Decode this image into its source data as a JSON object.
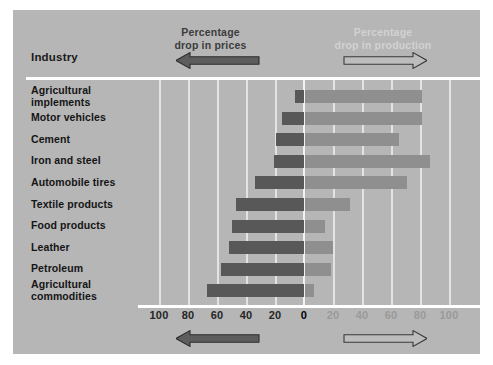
{
  "figure": {
    "background_color": "#b6b6b6",
    "page_color": "#ffffff",
    "industry_heading": "Industry",
    "left_title": "Percentage\ndrop in prices",
    "right_title": "Percentage\ndrop in production",
    "left_arrow_name": "left-pointing-arrow",
    "right_arrow_name": "right-pointing-arrow",
    "bar_left_color": "#585858",
    "bar_right_color": "#8f8f8f",
    "left_title_color": "#3c3c3c",
    "right_title_color": "#d2d2d2"
  },
  "chart_data": {
    "type": "bar",
    "orientation": "horizontal",
    "subtype": "diverging-bidirectional",
    "title": "",
    "xlabel": "",
    "ylabel": "Industry",
    "grid": true,
    "legend_position": "top",
    "categories": [
      "Agricultural\nimplements",
      "Motor vehicles",
      "Cement",
      "Iron and steel",
      "Automobile tires",
      "Textile products",
      "Food products",
      "Leather",
      "Petroleum",
      "Agricultural\ncommodities"
    ],
    "series": [
      {
        "name": "Percentage drop in prices",
        "direction": "left",
        "color": "#585858",
        "values": [
          6,
          15,
          19,
          21,
          34,
          47,
          50,
          52,
          57,
          67
        ]
      },
      {
        "name": "Percentage drop in production",
        "direction": "right",
        "color": "#8f8f8f",
        "values": [
          81,
          81,
          65,
          86,
          70,
          31,
          14,
          19,
          18,
          6
        ]
      }
    ],
    "left_axis_ticks": [
      100,
      80,
      60,
      40,
      20,
      0
    ],
    "right_axis_ticks": [
      20,
      40,
      60,
      80,
      100
    ],
    "xlim_left": [
      0,
      100
    ],
    "xlim_right": [
      0,
      100
    ],
    "tick_labels_left": [
      "100",
      "80",
      "60",
      "40",
      "20"
    ],
    "tick_label_zero": "0",
    "tick_labels_right": [
      "20",
      "40",
      "60",
      "80",
      "100"
    ]
  }
}
